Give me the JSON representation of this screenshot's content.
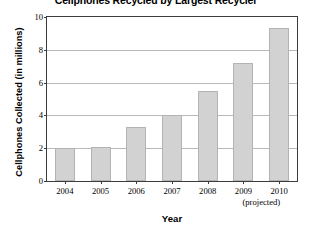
{
  "chart_data": {
    "type": "bar",
    "title": "Cellphones Recycled by Largest Recycler",
    "xlabel": "Year",
    "ylabel": "Cellphones Collected (in millions)",
    "categories": [
      "2004",
      "2005",
      "2006",
      "2007",
      "2008",
      "2009",
      "2010"
    ],
    "values": [
      2.0,
      2.1,
      3.3,
      4.0,
      5.5,
      7.2,
      9.3
    ],
    "ylim": [
      0,
      10
    ],
    "yticks": [
      0,
      2,
      4,
      6,
      8,
      10
    ],
    "ytick_labels": [
      "0",
      "2",
      "4",
      "6",
      "8",
      "10"
    ],
    "grid": true,
    "grid_axis": "y",
    "legend": false,
    "bar_color": "#d2d2d2",
    "bar_edge_color": "#b3b3b3",
    "frame_color": "#3c3c3c",
    "gridline_color": "#b9b9b9",
    "annotations": [
      {
        "text": "(projected)",
        "applies_to": [
          "2009",
          "2010"
        ],
        "position": "below-xtick-labels"
      }
    ]
  },
  "axes": {
    "y_title": "Cellphones Collected (in millions)",
    "x_title": "Year"
  },
  "notes": {
    "projected": "(projected)"
  }
}
